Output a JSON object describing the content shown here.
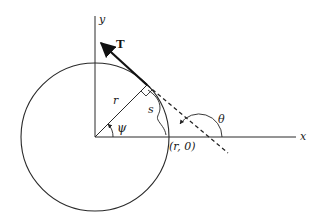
{
  "diagram": {
    "type": "geometry",
    "labels": {
      "x_axis": "x",
      "y_axis": "y",
      "tangent_vector": "T",
      "radius": "r",
      "arc_length": "s",
      "angle_psi": "ψ",
      "angle_theta": "θ",
      "point": "(r, 0)"
    },
    "colors": {
      "stroke": "#2a2a2a",
      "background": "#ffffff"
    },
    "geometry": {
      "origin": [
        95,
        137
      ],
      "circle_radius_px": 74,
      "tangent_point": [
        147,
        85
      ],
      "tangent_arrow_tip": [
        100,
        42
      ],
      "dashed_end": [
        227,
        153
      ],
      "x_axis_crossing": [
        199,
        137
      ]
    }
  }
}
